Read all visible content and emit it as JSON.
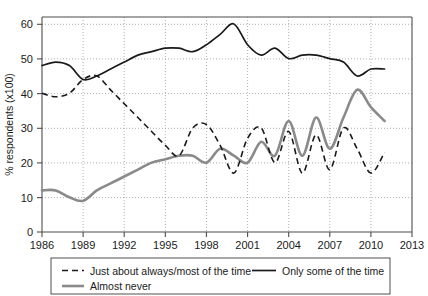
{
  "chart_data": {
    "type": "line",
    "title": "",
    "xlabel": "",
    "ylabel": "% respondents (x100)",
    "xlim": [
      1986,
      2013
    ],
    "ylim": [
      0,
      62
    ],
    "grid": true,
    "legend_position": "bottom",
    "xticks": [
      1986,
      1989,
      1992,
      1995,
      1998,
      2001,
      2004,
      2007,
      2010,
      2013
    ],
    "yticks": [
      0,
      10,
      20,
      30,
      40,
      50,
      60
    ],
    "x": [
      1986,
      1987,
      1988,
      1989,
      1990,
      1991,
      1992,
      1993,
      1994,
      1995,
      1996,
      1997,
      1998,
      1999,
      2000,
      2001,
      2002,
      2003,
      2004,
      2005,
      2006,
      2007,
      2008,
      2009,
      2010,
      2011
    ],
    "series": [
      {
        "name": "Just about always/most of the time",
        "style": "dashed",
        "color": "#1a1a1a",
        "values": [
          40,
          39,
          40,
          44,
          45,
          41,
          37,
          33,
          29,
          25,
          22,
          30,
          31,
          25,
          17,
          27,
          30,
          20,
          29,
          17,
          28,
          18,
          30,
          24,
          17,
          23
        ]
      },
      {
        "name": "Only some of the time",
        "style": "solid",
        "color": "#1a1a1a",
        "values": [
          48,
          49,
          48,
          44,
          45,
          47,
          49,
          51,
          52,
          53,
          53,
          52,
          54,
          57,
          60,
          54,
          51,
          53,
          50,
          51,
          51,
          50,
          49,
          45,
          47,
          47
        ]
      },
      {
        "name": "Almost never",
        "style": "solid-gray",
        "color": "#8a8a8a",
        "values": [
          12,
          12,
          10,
          9,
          12,
          14,
          16,
          18,
          20,
          21,
          22,
          22,
          20,
          24,
          22,
          20,
          26,
          22,
          32,
          22,
          33,
          24,
          33,
          41,
          36,
          32
        ]
      }
    ]
  },
  "axes": {
    "ylabel": "% respondents (x100)",
    "ytick_labels": [
      "0",
      "10",
      "20",
      "30",
      "40",
      "50",
      "60"
    ],
    "xtick_labels": [
      "1986",
      "1989",
      "1992",
      "1995",
      "1998",
      "2001",
      "2004",
      "2007",
      "2010",
      "2013"
    ]
  },
  "legend": {
    "entries": [
      {
        "label": "Just about always/most of the time",
        "style": "dashed",
        "color": "#1a1a1a"
      },
      {
        "label": "Only some of the time",
        "style": "solid",
        "color": "#1a1a1a"
      },
      {
        "label": "Almost never",
        "style": "solid-gray",
        "color": "#8a8a8a"
      }
    ]
  }
}
